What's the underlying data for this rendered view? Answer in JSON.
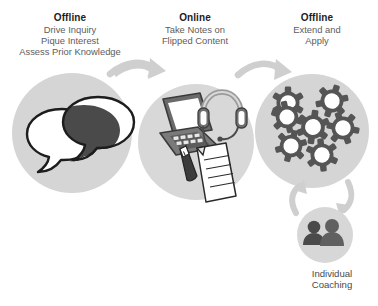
{
  "diagram": {
    "background_color": "#ffffff",
    "circle_fill": "#d5d5d5",
    "circle_fill_alt": "#d8d8d8",
    "arrow_color": "#c9c9c9",
    "dark_ink": "#4a4a4a",
    "outline_color": "#1d1d1d",
    "white": "#ffffff"
  },
  "stages": [
    {
      "id": "stage-offline-inquiry",
      "title": "Offline",
      "lines": [
        "Drive Inquiry",
        "Pique Interest",
        "Assess Prior Knowledge"
      ],
      "icon": "speech-bubbles-icon"
    },
    {
      "id": "stage-online-notes",
      "title": "Online",
      "lines": [
        "Take Notes on",
        "Flipped Content"
      ],
      "icon": "laptop-headset-notes-icon"
    },
    {
      "id": "stage-offline-extend",
      "title": "Offline",
      "lines": [
        "Extend and",
        "Apply"
      ],
      "icon": "gears-cluster-icon"
    }
  ],
  "coaching": {
    "id": "stage-individual-coaching",
    "lines": [
      "Individual",
      "Coaching"
    ],
    "icon": "two-people-icon"
  },
  "arrows": [
    {
      "id": "arrow-stage1-to-stage2",
      "direction": "right"
    },
    {
      "id": "arrow-stage2-to-stage3",
      "direction": "right"
    },
    {
      "id": "arrow-stage3-to-coaching",
      "direction": "down"
    },
    {
      "id": "arrow-coaching-to-stage3",
      "direction": "up"
    }
  ]
}
